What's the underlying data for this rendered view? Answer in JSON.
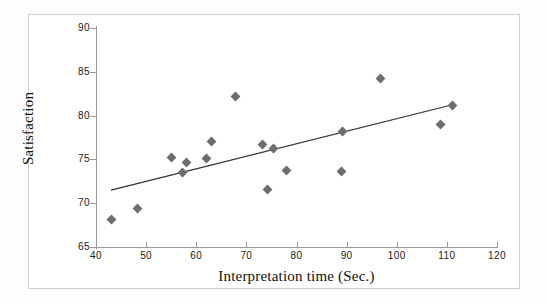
{
  "chart_data": {
    "type": "scatter",
    "title": "",
    "xlabel": "Interpretation time  (Sec.)",
    "ylabel": "Satisfaction",
    "xlim": [
      40,
      120
    ],
    "ylim": [
      65,
      90
    ],
    "xticks": [
      40,
      50,
      60,
      70,
      80,
      90,
      100,
      110,
      120
    ],
    "yticks": [
      65,
      70,
      75,
      80,
      85,
      90
    ],
    "grid": false,
    "legend": null,
    "marker": "diamond",
    "marker_color": "#6e6e6e",
    "line_color": "#333333",
    "points": [
      {
        "x": 43.0,
        "y": 68.1
      },
      {
        "x": 48.2,
        "y": 69.4
      },
      {
        "x": 55.0,
        "y": 75.2
      },
      {
        "x": 57.2,
        "y": 73.5
      },
      {
        "x": 58.0,
        "y": 74.7
      },
      {
        "x": 62.0,
        "y": 75.1
      },
      {
        "x": 63.0,
        "y": 77.0
      },
      {
        "x": 67.8,
        "y": 82.2
      },
      {
        "x": 73.2,
        "y": 76.7
      },
      {
        "x": 74.2,
        "y": 71.6
      },
      {
        "x": 75.4,
        "y": 76.3
      },
      {
        "x": 78.0,
        "y": 73.7
      },
      {
        "x": 89.0,
        "y": 73.6
      },
      {
        "x": 89.2,
        "y": 78.2
      },
      {
        "x": 96.8,
        "y": 84.2
      },
      {
        "x": 108.8,
        "y": 79.0
      },
      {
        "x": 111.2,
        "y": 81.2
      }
    ],
    "trendline": {
      "type": "linear",
      "x_start": 43.0,
      "y_start": 71.5,
      "x_end": 111.5,
      "y_end": 81.3
    }
  }
}
